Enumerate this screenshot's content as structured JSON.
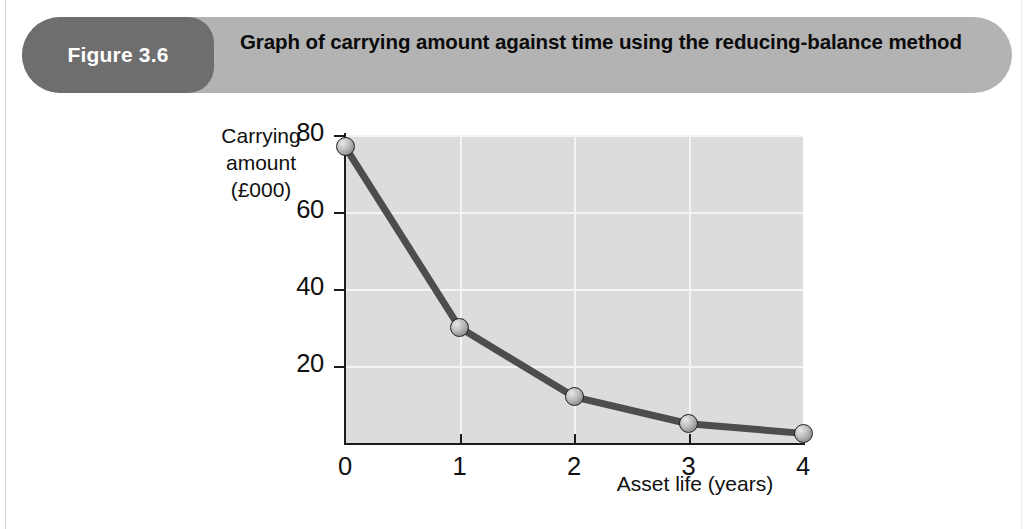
{
  "figure": {
    "badge_label": "Figure 3.6",
    "title": "Graph of carrying amount against time using the reducing-balance method",
    "badge_color": "#6e6e6e",
    "banner_color": "#b3b3b3"
  },
  "chart_data": {
    "type": "line",
    "title": "Graph of carrying amount against time using the reducing-balance method",
    "xlabel": "Asset life (years)",
    "ylabel": "Carrying amount (£000)",
    "ylabel_lines": [
      "Carrying",
      "amount",
      "(£000)"
    ],
    "x": [
      0,
      1,
      2,
      3,
      4
    ],
    "values": [
      77,
      30,
      12,
      5,
      2.5
    ],
    "series": [
      {
        "name": "Carrying amount (reducing-balance)",
        "values": [
          77,
          30,
          12,
          5,
          2.5
        ]
      }
    ],
    "xlim": [
      0,
      4
    ],
    "ylim": [
      0,
      80
    ],
    "xticks": [
      "0",
      "1",
      "2",
      "3",
      "4"
    ],
    "yticks": [
      "20",
      "40",
      "60",
      "80"
    ],
    "ytick_values": [
      20,
      40,
      60,
      80
    ],
    "grid": true,
    "legend": "none",
    "plot_bg": "#dcdcdc",
    "gridline_color": "#f4f4f4",
    "line_color": "#4d4d4d",
    "marker_style": "sphere"
  }
}
